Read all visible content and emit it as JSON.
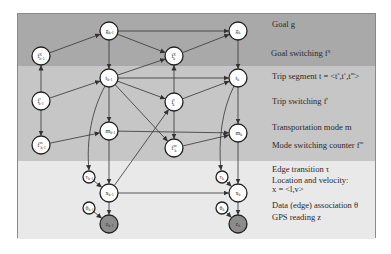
{
  "diagram": {
    "type": "dynamic-bayesian-network",
    "bands": [
      {
        "name": "goal-layer",
        "color": "#a9a9a9"
      },
      {
        "name": "trip-layer",
        "color": "#c6c6c6"
      },
      {
        "name": "observation-layer",
        "color": "#e9e9e9"
      }
    ],
    "nodes": [
      {
        "id": "g_km1",
        "label": "g",
        "sub": "k-1",
        "sup": "",
        "x": 109,
        "y": 31,
        "r": 9,
        "shaded": false
      },
      {
        "id": "g_k",
        "label": "g",
        "sub": "k",
        "sup": "",
        "x": 238,
        "y": 31,
        "r": 9,
        "shaded": false
      },
      {
        "id": "fg_km1",
        "label": "f",
        "sub": "k-1",
        "sup": "g",
        "x": 41,
        "y": 56,
        "r": 9,
        "shaded": false
      },
      {
        "id": "fg_k",
        "label": "f",
        "sub": "k",
        "sup": "g",
        "x": 174,
        "y": 56,
        "r": 9,
        "shaded": false
      },
      {
        "id": "t_km1",
        "label": "t",
        "sub": "k-1",
        "sup": "",
        "x": 109,
        "y": 78,
        "r": 9,
        "shaded": false
      },
      {
        "id": "t_k",
        "label": "t",
        "sub": "k",
        "sup": "",
        "x": 238,
        "y": 78,
        "r": 9,
        "shaded": false
      },
      {
        "id": "ft_km1",
        "label": "f",
        "sub": "k-1",
        "sup": "t",
        "x": 41,
        "y": 101,
        "r": 9,
        "shaded": false
      },
      {
        "id": "ft_k",
        "label": "f",
        "sub": "k",
        "sup": "t",
        "x": 174,
        "y": 102,
        "r": 9,
        "shaded": false
      },
      {
        "id": "m_km1",
        "label": "m",
        "sub": "k-1",
        "sup": "",
        "x": 109,
        "y": 131,
        "r": 9,
        "shaded": false
      },
      {
        "id": "m_k",
        "label": "m",
        "sub": "k",
        "sup": "",
        "x": 238,
        "y": 133,
        "r": 9,
        "shaded": false
      },
      {
        "id": "fm_km1",
        "label": "f",
        "sub": "k-1",
        "sup": "m",
        "x": 41,
        "y": 145,
        "r": 9,
        "shaded": false
      },
      {
        "id": "fm_k",
        "label": "f",
        "sub": "k",
        "sup": "m",
        "x": 174,
        "y": 148,
        "r": 9,
        "shaded": false
      },
      {
        "id": "tau_km1",
        "label": "τ",
        "sub": "k-1",
        "sup": "",
        "x": 89,
        "y": 177,
        "r": 6,
        "shaded": false
      },
      {
        "id": "tau_k",
        "label": "τ",
        "sub": "k",
        "sup": "",
        "x": 222,
        "y": 177,
        "r": 6,
        "shaded": false
      },
      {
        "id": "x_km1",
        "label": "x",
        "sub": "k-1",
        "sup": "",
        "x": 109,
        "y": 193,
        "r": 9,
        "shaded": false
      },
      {
        "id": "x_k",
        "label": "x",
        "sub": "k",
        "sup": "",
        "x": 238,
        "y": 193,
        "r": 9,
        "shaded": false
      },
      {
        "id": "theta_km1",
        "label": "θ",
        "sub": "k-1",
        "sup": "",
        "x": 89,
        "y": 208,
        "r": 6,
        "shaded": false
      },
      {
        "id": "theta_k",
        "label": "θ",
        "sub": "k",
        "sup": "",
        "x": 222,
        "y": 208,
        "r": 6,
        "shaded": false
      },
      {
        "id": "z_km1",
        "label": "z",
        "sub": "k-1",
        "sup": "",
        "x": 109,
        "y": 224,
        "r": 9,
        "shaded": true
      },
      {
        "id": "z_k",
        "label": "z",
        "sub": "k",
        "sup": "",
        "x": 238,
        "y": 224,
        "r": 9,
        "shaded": true
      }
    ],
    "edges": [
      [
        "fg_km1",
        "g_km1"
      ],
      [
        "g_km1",
        "g_k"
      ],
      [
        "g_km1",
        "fg_k"
      ],
      [
        "fg_k",
        "g_k"
      ],
      [
        "g_km1",
        "t_km1"
      ],
      [
        "g_k",
        "t_k"
      ],
      [
        "ft_km1",
        "fg_km1"
      ],
      [
        "ft_km1",
        "t_km1"
      ],
      [
        "ft_km1",
        "fm_km1"
      ],
      [
        "t_km1",
        "fg_k"
      ],
      [
        "t_km1",
        "t_k"
      ],
      [
        "t_km1",
        "ft_k"
      ],
      [
        "t_km1",
        "m_km1"
      ],
      [
        "t_km1",
        "fm_k"
      ],
      [
        "ft_k",
        "fg_k"
      ],
      [
        "ft_k",
        "t_k"
      ],
      [
        "ft_k",
        "fm_k"
      ],
      [
        "fm_km1",
        "m_km1"
      ],
      [
        "m_km1",
        "m_k"
      ],
      [
        "fm_k",
        "m_k"
      ],
      [
        "t_k",
        "m_k"
      ],
      [
        "m_km1",
        "x_km1"
      ],
      [
        "m_k",
        "x_k"
      ],
      [
        "x_km1",
        "ft_k"
      ],
      [
        "x_km1",
        "x_k"
      ],
      [
        "tau_km1",
        "x_km1"
      ],
      [
        "tau_k",
        "x_k"
      ],
      [
        "x_km1",
        "z_km1"
      ],
      [
        "x_k",
        "z_k"
      ],
      [
        "theta_km1",
        "z_km1"
      ],
      [
        "theta_k",
        "z_k"
      ]
    ],
    "curved_edges": [
      {
        "from": "t_km1",
        "to": "tau_km1",
        "path": "M105,86 C92,110 86,140 89,170"
      },
      {
        "from": "t_k",
        "to": "tau_k",
        "path": "M234,86 C222,110 218,140 221,170"
      }
    ],
    "legend": [
      {
        "id": "goal",
        "text": "Goal g",
        "x": 272,
        "y": 26
      },
      {
        "id": "goal-switching",
        "text": "Goal switching  f",
        "sup": "g",
        "x": 271,
        "y": 52
      },
      {
        "id": "trip-segment",
        "text": "Trip segment t = <t",
        "tail": "s",
        "tail2": ",t",
        "tail3": "e",
        "tail4": ",t",
        "tail5": "m",
        "tail6": ">",
        "x": 272,
        "y": 75
      },
      {
        "id": "trip-switching",
        "text": "Trip switching  f",
        "sup": "t",
        "x": 272,
        "y": 100
      },
      {
        "id": "transportation-mode",
        "text": "Transportation mode m",
        "x": 272,
        "y": 129
      },
      {
        "id": "mode-switching",
        "text": "Mode switching counter  f",
        "sup": "m",
        "x": 272,
        "y": 144
      },
      {
        "id": "edge-transition",
        "text": "Edge transition  τ",
        "x": 272,
        "y": 171
      },
      {
        "id": "location-velocity",
        "text": "Location and velocity:",
        "x": 272,
        "y": 182
      },
      {
        "id": "location-velocity-formula",
        "text": "x = <l,v>",
        "x": 272,
        "y": 191
      },
      {
        "id": "data-association",
        "text": "Data (edge) association  θ",
        "x": 272,
        "y": 207
      },
      {
        "id": "gps-reading",
        "text": "GPS reading z",
        "x": 272,
        "y": 219
      }
    ]
  }
}
